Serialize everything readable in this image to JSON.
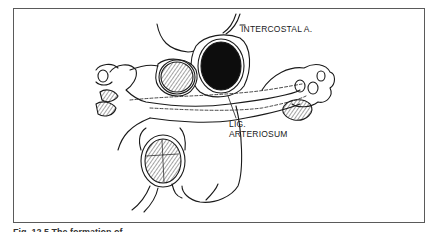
{
  "figure": {
    "labels": {
      "intercostal": "INTERCOSTAL A.",
      "lig_line1": "LIG.",
      "lig_line2": "ARTERIOSUM"
    },
    "caption": "Fig. 12.5 The formation of ..."
  },
  "colors": {
    "ink": "#1a1a1a",
    "frame": "#5a5a5a",
    "background": "#ffffff"
  }
}
